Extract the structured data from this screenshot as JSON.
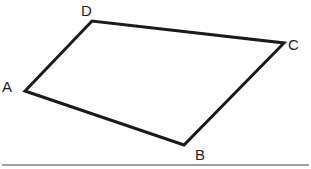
{
  "diagram": {
    "type": "quadrilateral",
    "stroke_color": "#1a1a1a",
    "rule_color": "#444444",
    "vertices": [
      {
        "label": "A",
        "x": 25,
        "y": 91
      },
      {
        "label": "B",
        "x": 184,
        "y": 145
      },
      {
        "label": "C",
        "x": 284,
        "y": 43
      },
      {
        "label": "D",
        "x": 92,
        "y": 21
      }
    ],
    "labels": {
      "A": "A",
      "B": "B",
      "C": "C",
      "D": "D"
    }
  }
}
